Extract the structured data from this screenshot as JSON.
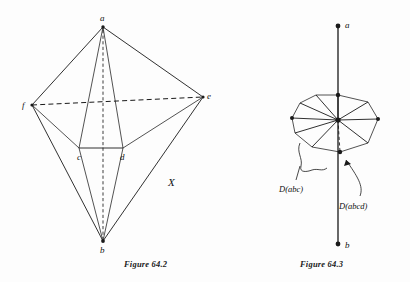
{
  "page": {
    "background_color": "#fdfdfd",
    "ink_color": "#1a1a1a"
  },
  "figures": [
    {
      "id": "figure-64-2",
      "caption": "Figure 64.2",
      "region_label": "X",
      "vertex_labels": [
        "a",
        "f",
        "e",
        "c",
        "d",
        "b"
      ],
      "vertices": {
        "a": {
          "label": "a",
          "x": 103,
          "y": 27
        },
        "f": {
          "label": "f",
          "x": 32,
          "y": 105
        },
        "e": {
          "label": "e",
          "x": 203,
          "y": 97
        },
        "c": {
          "label": "c",
          "x": 79,
          "y": 152
        },
        "d": {
          "label": "d",
          "x": 122,
          "y": 152
        },
        "b": {
          "label": "b",
          "x": 103,
          "y": 241
        }
      },
      "edges_solid": [
        "a-f",
        "a-e",
        "a-c",
        "a-d",
        "f-c",
        "f-b",
        "e-d",
        "e-b",
        "c-d",
        "c-b",
        "d-b",
        "f-e-outer-b"
      ],
      "edges_dashed": [
        "f-e",
        "a-b"
      ]
    },
    {
      "id": "figure-64-3",
      "caption": "Figure 64.3",
      "vertex_labels": [
        "a",
        "b"
      ],
      "vertices": {
        "a": {
          "label": "a",
          "x": 338,
          "y": 26
        },
        "b": {
          "label": "b",
          "x": 338,
          "y": 244
        }
      },
      "annotations": [
        {
          "name": "d-abc-label",
          "text": "D(abc)",
          "x": 281,
          "y": 190
        },
        {
          "name": "d-abcd-label",
          "text": "D(abcd)",
          "x": 357,
          "y": 205
        }
      ],
      "hub": {
        "x": 338,
        "y": 120
      },
      "description": "star/fan polygon of triangles around a central hub on a vertical axis"
    }
  ]
}
